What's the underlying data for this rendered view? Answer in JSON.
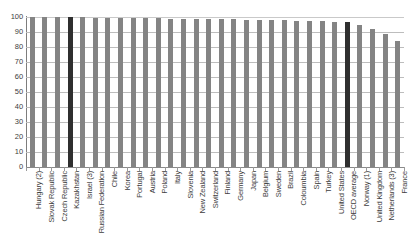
{
  "chart_data": {
    "type": "bar",
    "title": "",
    "subtitle": "",
    "xlabel": "",
    "ylabel": "",
    "ylim": [
      0,
      100
    ],
    "ytick_values": [
      0,
      10,
      20,
      30,
      40,
      50,
      60,
      70,
      80,
      90,
      100
    ],
    "ytick_labels": [
      "0",
      "10",
      "20",
      "30",
      "40",
      "50",
      "60",
      "70",
      "80",
      "90",
      "100"
    ],
    "grid": true,
    "legend": "none",
    "highlight_color": "#2f2f2f",
    "bar_color": "#848484",
    "highlighted_categories": [
      "Kazakhstan",
      "OECD average"
    ],
    "categories": [
      "Hungary (2)",
      "Slovak Republic",
      "Czech Republic",
      "Kazakhstan",
      "Israel (3)",
      "Russian Federation",
      "Chile",
      "Korea",
      "Portugal",
      "Austria",
      "Poland",
      "Italy",
      "Slovenia",
      "New Zealand",
      "Switzerland",
      "Finland",
      "Germany",
      "Japan",
      "Belgium",
      "Sweden",
      "Brazil",
      "Coloumbia",
      "Spain",
      "Turkey",
      "United States",
      "OECD average",
      "Norway (1)",
      "United Kingdom",
      "Netherlands (3)",
      "France"
    ],
    "values": [
      100,
      100,
      100,
      100,
      100,
      99.6,
      99.5,
      99.4,
      99.3,
      99.2,
      99.1,
      99.0,
      98.9,
      98.8,
      98.6,
      98.5,
      98.4,
      98.2,
      98.1,
      98.0,
      97.8,
      97.6,
      97.4,
      97.2,
      97.0,
      96.5,
      94.5,
      92.0,
      88.5,
      84.0
    ]
  }
}
